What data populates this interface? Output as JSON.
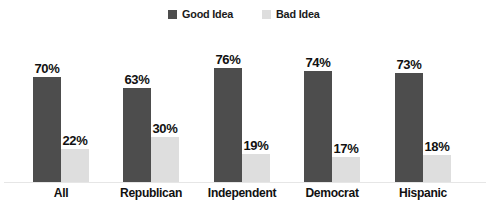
{
  "chart_data": {
    "type": "bar",
    "title": "",
    "subtitle": "",
    "xlabel": "",
    "ylabel": "",
    "ylim": [
      0,
      100
    ],
    "grid": false,
    "legend_position": "top-center",
    "categories": [
      "All",
      "Republican",
      "Independent",
      "Democrat",
      "Hispanic"
    ],
    "series": [
      {
        "name": "Good Idea",
        "color": "#4d4d4d",
        "values": [
          70,
          63,
          76,
          74,
          73
        ],
        "labels": [
          "70%",
          "63%",
          "76%",
          "74%",
          "73%"
        ]
      },
      {
        "name": "Bad Idea",
        "color": "#dedede",
        "values": [
          22,
          30,
          19,
          17,
          18
        ],
        "labels": [
          "22%",
          "30%",
          "19%",
          "17%",
          "18%"
        ]
      }
    ]
  },
  "legend": {
    "entries": [
      {
        "label": "Good Idea",
        "color": "#4d4d4d"
      },
      {
        "label": "Bad Idea",
        "color": "#dedede"
      }
    ]
  },
  "colors": {
    "good_idea": "#4d4d4d",
    "bad_idea": "#dedede",
    "background": "#ffffff",
    "text": "#111111",
    "baseline": "#e6e6e6"
  }
}
